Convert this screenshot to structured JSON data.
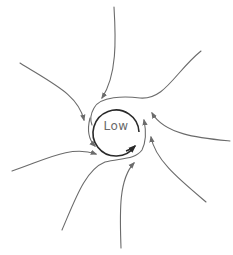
{
  "diagram": {
    "center_label": "Low",
    "colors": {
      "background": "#ffffff",
      "flow_lines": "#6b6b6b",
      "core_circle": "#2a2a2a",
      "label": "#6a6a6a"
    },
    "core": {
      "cx": 116,
      "cy": 130,
      "r": 23,
      "rotation": "counterclockwise"
    },
    "inflow_arrows": [
      {
        "name": "top",
        "from": [
          114,
          7
        ],
        "to": [
          102,
          98
        ]
      },
      {
        "name": "upper-right",
        "from": [
          201,
          51
        ],
        "to": [
          92,
          125
        ]
      },
      {
        "name": "upper-left",
        "from": [
          20,
          63
        ],
        "to": [
          84,
          120
        ]
      },
      {
        "name": "left",
        "from": [
          12,
          171
        ],
        "to": [
          96,
          154
        ]
      },
      {
        "name": "lower-left",
        "from": [
          62,
          230
        ],
        "to": [
          137,
          156
        ]
      },
      {
        "name": "bottom",
        "from": [
          121,
          248
        ],
        "to": [
          134,
          163
        ]
      },
      {
        "name": "lower-right",
        "from": [
          206,
          202
        ],
        "to": [
          151,
          137
        ]
      },
      {
        "name": "right",
        "from": [
          230,
          141
        ],
        "to": [
          152,
          113
        ]
      }
    ]
  }
}
